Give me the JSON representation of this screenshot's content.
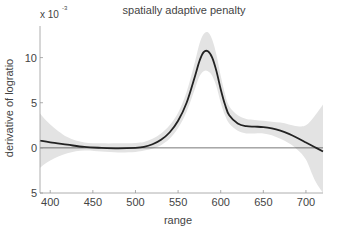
{
  "chart_data": {
    "type": "line",
    "title": "spatially adaptive penalty",
    "xlabel": "range",
    "ylabel": "derivative of logratio",
    "y_scale_note": "x 10^-3",
    "y_exponent_label": "x 10",
    "y_exponent_value": "-3",
    "xlim": [
      388,
      720
    ],
    "ylim": [
      -5,
      13.5
    ],
    "xticks": [
      400,
      450,
      500,
      550,
      600,
      650,
      700
    ],
    "yticks": [
      -5,
      0,
      5,
      10
    ],
    "ytick_labels": [
      "5",
      "0",
      "5",
      "10"
    ],
    "grid": false,
    "legend": null,
    "reference_line": {
      "y": 0,
      "color": "#555555"
    },
    "series": [
      {
        "name": "estimate",
        "color": "#222222",
        "x": [
          388,
          400,
          420,
          440,
          460,
          480,
          500,
          510,
          520,
          530,
          540,
          550,
          560,
          570,
          575,
          580,
          585,
          590,
          595,
          600,
          605,
          610,
          620,
          630,
          640,
          650,
          660,
          670,
          680,
          690,
          700,
          710,
          720
        ],
        "y": [
          0.8,
          0.6,
          0.35,
          0.1,
          0.0,
          -0.05,
          0.0,
          0.1,
          0.4,
          0.9,
          1.7,
          3.0,
          5.0,
          8.0,
          9.6,
          10.6,
          10.7,
          10.0,
          8.5,
          6.5,
          4.8,
          3.6,
          2.7,
          2.4,
          2.35,
          2.3,
          2.15,
          1.9,
          1.55,
          1.1,
          0.6,
          0.1,
          -0.4
        ]
      }
    ],
    "confidence_band": {
      "color": "#e3e3e3",
      "x": [
        388,
        400,
        420,
        440,
        460,
        480,
        500,
        510,
        520,
        530,
        540,
        550,
        560,
        570,
        575,
        580,
        585,
        590,
        595,
        600,
        605,
        610,
        620,
        630,
        640,
        650,
        660,
        670,
        680,
        690,
        700,
        710,
        720
      ],
      "upper": [
        3.8,
        2.6,
        1.2,
        0.6,
        0.5,
        0.5,
        0.55,
        0.65,
        1.0,
        1.6,
        2.5,
        3.9,
        6.2,
        9.6,
        11.5,
        12.6,
        12.8,
        12.0,
        10.3,
        8.0,
        6.0,
        4.6,
        3.6,
        3.2,
        3.1,
        3.0,
        2.9,
        2.8,
        2.6,
        2.4,
        2.5,
        3.5,
        4.8
      ],
      "lower": [
        -2.2,
        -1.4,
        -0.6,
        -0.3,
        -0.4,
        -0.5,
        -0.45,
        -0.3,
        -0.1,
        0.3,
        1.0,
        2.2,
        4.0,
        6.6,
        7.9,
        8.5,
        8.5,
        8.0,
        6.8,
        5.0,
        3.6,
        2.7,
        1.9,
        1.6,
        1.6,
        1.6,
        1.4,
        1.0,
        0.5,
        -0.2,
        -1.3,
        -3.5,
        -5.0
      ]
    }
  }
}
